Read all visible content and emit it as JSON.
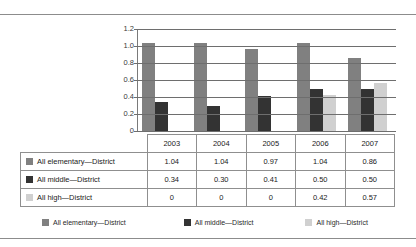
{
  "chart_data": {
    "type": "bar",
    "title": "",
    "xlabel": "",
    "ylabel": "",
    "ylim": [
      0,
      1.2
    ],
    "yticks": [
      "0",
      "0.2",
      "0.4",
      "0.6",
      "0.8",
      "1.0",
      "1.2"
    ],
    "grid": true,
    "legend_position": "bottom",
    "categories": [
      "2003",
      "2004",
      "2005",
      "2006",
      "2007"
    ],
    "series": [
      {
        "name": "All elementary—District",
        "color": "#808080",
        "values": [
          1.04,
          1.04,
          0.97,
          1.04,
          0.86
        ],
        "labels": [
          "1.04",
          "1.04",
          "0.97",
          "1.04",
          "0.86"
        ]
      },
      {
        "name": "All middle—District",
        "color": "#333333",
        "values": [
          0.34,
          0.3,
          0.41,
          0.5,
          0.5
        ],
        "labels": [
          "0.34",
          "0.30",
          "0.41",
          "0.50",
          "0.50"
        ]
      },
      {
        "name": "All high—District",
        "color": "#d0d0d0",
        "values": [
          0,
          0,
          0,
          0.42,
          0.57
        ],
        "labels": [
          "0",
          "0",
          "0",
          "0.42",
          "0.57"
        ]
      }
    ]
  }
}
